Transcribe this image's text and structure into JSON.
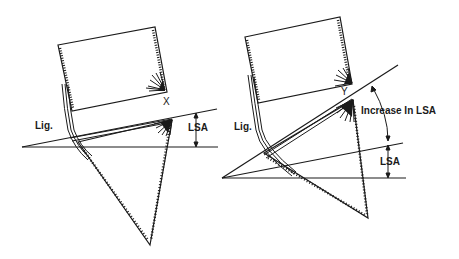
{
  "diagram": {
    "left_panel": {
      "labels": {
        "ligament": "Lig.",
        "point": "X",
        "angle": "LSA"
      }
    },
    "right_panel": {
      "labels": {
        "ligament": "Lig.",
        "point": "Y",
        "increase": "Increase In LSA",
        "angle": "LSA"
      }
    },
    "colors": {
      "line": "#1a1a1a",
      "background": "#ffffff"
    }
  }
}
